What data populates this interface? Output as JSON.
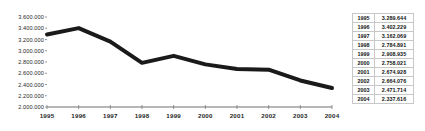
{
  "chart_data": {
    "type": "line",
    "title": "",
    "subtitle": "",
    "xlabel": "",
    "ylabel": "",
    "categories": [
      "1995",
      "1996",
      "1997",
      "1998",
      "1999",
      "2000",
      "2001",
      "2002",
      "2003",
      "2004"
    ],
    "values": [
      3289644,
      3402229,
      3162069,
      2784891,
      2908935,
      2758021,
      2674928,
      2664076,
      2471714,
      2337616
    ],
    "value_labels": [
      "3.289.644",
      "3.402.229",
      "3.162.069",
      "2.784.891",
      "2.908.935",
      "2.758.021",
      "2.674.928",
      "2.664.076",
      "2.471.714",
      "2.337.616"
    ],
    "ylim": [
      2000000,
      3600000
    ],
    "ytick_labels": [
      "3.600.000",
      "3.400.000",
      "3.200.000",
      "3.000.000",
      "2.800.000",
      "2.600.000",
      "2.400.000",
      "2.200.000",
      "2.000.000"
    ],
    "ytick_values": [
      3600000,
      3400000,
      3200000,
      3000000,
      2800000,
      2600000,
      2400000,
      2200000,
      2000000
    ],
    "xtick_labels": [
      "1995",
      "1996",
      "1997",
      "1998",
      "1999",
      "2000",
      "2001",
      "2002",
      "2003",
      "2004"
    ],
    "grid": false,
    "legend": "none",
    "series_color": "#1a1a1a",
    "axis_color": "#6f6f6f",
    "line_width": 4
  },
  "table": {
    "columns": [
      "year",
      "value"
    ],
    "rows": [
      {
        "year": "1995",
        "value": "3.289.644"
      },
      {
        "year": "1996",
        "value": "3.402.229"
      },
      {
        "year": "1997",
        "value": "3.162.069"
      },
      {
        "year": "1998",
        "value": "2.784.891"
      },
      {
        "year": "1999",
        "value": "2.908.935"
      },
      {
        "year": "2000",
        "value": "2.758.021"
      },
      {
        "year": "2001",
        "value": "2.674.928"
      },
      {
        "year": "2002",
        "value": "2.664.076"
      },
      {
        "year": "2003",
        "value": "2.471.714"
      },
      {
        "year": "2004",
        "value": "2.337.616"
      }
    ],
    "border_color": "#c8c8c8"
  }
}
